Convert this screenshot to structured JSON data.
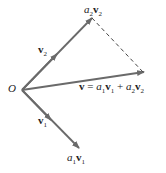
{
  "diagram": {
    "colors": {
      "vector": "#6a6a6a",
      "dashed": "#444444",
      "text": "#222222"
    },
    "labels": {
      "origin": "O",
      "v2": {
        "bold": "v",
        "sub": "2"
      },
      "v1": {
        "bold": "v",
        "sub": "1"
      },
      "a2v2": {
        "a": "a",
        "asub": "2",
        "v": "v",
        "vsub": "2"
      },
      "a1v1": {
        "a": "a",
        "asub": "1",
        "v": "v",
        "vsub": "1"
      },
      "v_eq": {
        "lhs": "v",
        "eq": " = ",
        "a1": "a",
        "a1sub": "1",
        "v1": "v",
        "v1sub": "1",
        "plus": " + ",
        "a2": "a",
        "a2sub": "2",
        "v2": "v",
        "v2sub": "2"
      }
    },
    "points": {
      "O": [
        22,
        90
      ],
      "a2v2_tip": [
        92,
        18
      ],
      "v_tip": [
        144,
        72
      ],
      "a1v1_tip": [
        79,
        148
      ],
      "v2_arrow": [
        56,
        55
      ],
      "v1_arrow": [
        50,
        120
      ]
    }
  }
}
